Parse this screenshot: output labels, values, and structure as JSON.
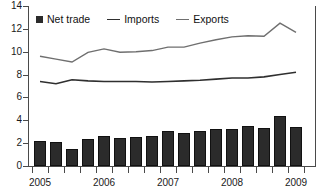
{
  "chart_data": {
    "type": "bar",
    "title": "",
    "xlabel": "",
    "ylabel": "",
    "ylim": [
      0,
      14
    ],
    "yticks": [
      0,
      2,
      4,
      6,
      8,
      10,
      12,
      14
    ],
    "grid": false,
    "legend_position": "top-left",
    "categories": [
      "2005 Q1",
      "2005 Q2",
      "2005 Q3",
      "2005 Q4",
      "2006 Q1",
      "2006 Q2",
      "2006 Q3",
      "2006 Q4",
      "2007 Q1",
      "2007 Q2",
      "2007 Q3",
      "2007 Q4",
      "2008 Q1",
      "2008 Q2",
      "2008 Q3",
      "2008 Q4",
      "2009 Q1"
    ],
    "xtick_labels": [
      "2005",
      "2006",
      "2007",
      "2008",
      "2009"
    ],
    "xtick_label_index": [
      0,
      4,
      8,
      12,
      16
    ],
    "series": [
      {
        "name": "Net trade",
        "type": "bar",
        "color": "#2b2b2b",
        "values": [
          2.2,
          2.1,
          1.5,
          2.4,
          2.65,
          2.45,
          2.5,
          2.65,
          3.1,
          2.85,
          3.05,
          3.25,
          3.25,
          3.5,
          3.3,
          4.35,
          3.4
        ]
      },
      {
        "name": "Imports",
        "type": "line",
        "color": "#2f2f2f",
        "values": [
          7.4,
          7.2,
          7.55,
          7.45,
          7.4,
          7.4,
          7.4,
          7.35,
          7.4,
          7.45,
          7.5,
          7.6,
          7.7,
          7.7,
          7.8,
          8.0,
          8.2
        ]
      },
      {
        "name": "Exports",
        "type": "line",
        "color": "#6f6f6f",
        "values": [
          9.6,
          9.35,
          9.1,
          9.95,
          10.25,
          9.95,
          10.0,
          10.1,
          10.4,
          10.4,
          10.75,
          11.05,
          11.3,
          11.4,
          11.35,
          12.5,
          11.7
        ]
      }
    ]
  },
  "legend": {
    "items": [
      {
        "label": "Net trade",
        "marker": "square-swatch"
      },
      {
        "label": "Imports",
        "marker": "line-swatch"
      },
      {
        "label": "Exports",
        "marker": "line-swatch"
      }
    ]
  }
}
